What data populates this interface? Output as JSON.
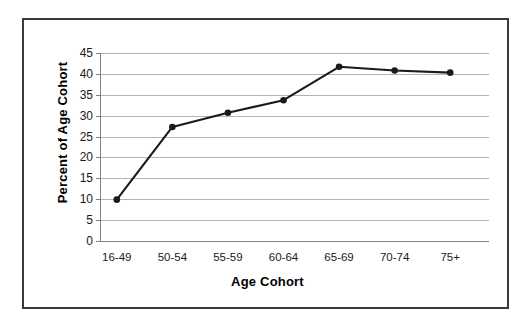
{
  "chart_data": {
    "type": "line",
    "title": "",
    "subtitle": "",
    "xlabel": "Age Cohort",
    "ylabel": "Percent of Age Cohort",
    "categories": [
      "16-49",
      "50-54",
      "55-59",
      "60-64",
      "65-69",
      "70-74",
      "75+"
    ],
    "values": [
      9.9,
      27.3,
      30.7,
      33.7,
      41.7,
      40.8,
      40.3
    ],
    "series": [
      {
        "name": "Percent of Age Cohort",
        "values": [
          9.9,
          27.3,
          30.7,
          33.7,
          41.7,
          40.8,
          40.3
        ]
      }
    ],
    "ylim": [
      0,
      45
    ],
    "y_ticks": [
      0,
      5,
      10,
      15,
      20,
      25,
      30,
      35,
      40,
      45
    ],
    "y_tick_labels": [
      "0",
      "5",
      "10",
      "15",
      "20",
      "25",
      "30",
      "35",
      "40",
      "45"
    ],
    "grid": true,
    "grid_axis": "y",
    "legend": "none",
    "marker": "filled-circle",
    "line_color": "#1a1a1a",
    "marker_color": "#1a1a1a",
    "grid_color": "#b3b3b3",
    "axis_color": "#808080",
    "plot_background": "#ffffff",
    "border_color": "#3a3a3a"
  }
}
